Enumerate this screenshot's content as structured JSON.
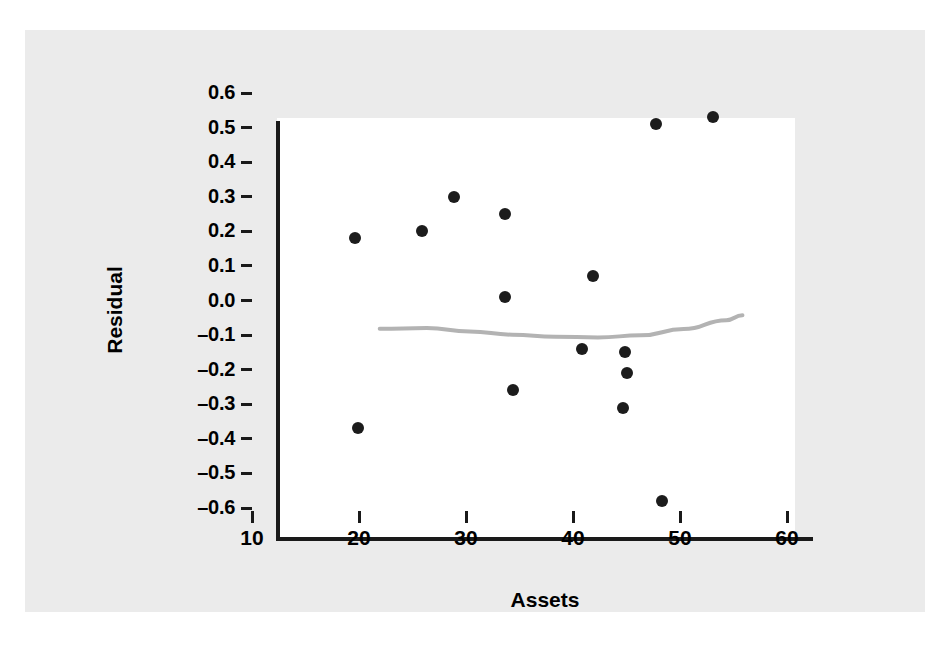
{
  "figure": {
    "background_color": "#ebebeb",
    "panel_color": "#ffffff",
    "axis_color": "#1a1a1a",
    "point_color": "#1c1c1c",
    "smoother_color": "#b3b3b3"
  },
  "chart_data": {
    "type": "scatter",
    "title": "",
    "xlabel": "Assets",
    "ylabel": "Residual",
    "xlim": [
      10,
      60
    ],
    "ylim": [
      -0.6,
      0.6
    ],
    "grid": false,
    "legend": null,
    "xticks": [
      10,
      20,
      30,
      40,
      50,
      60
    ],
    "xtick_labels": [
      "10",
      "20",
      "30",
      "40",
      "50",
      "60"
    ],
    "yticks": [
      0.6,
      0.5,
      0.4,
      0.3,
      0.2,
      0.1,
      0.0,
      -0.1,
      -0.2,
      -0.3,
      -0.4,
      -0.5,
      -0.6
    ],
    "ytick_labels": [
      "0.6",
      "0.5",
      "0.4",
      "0.3",
      "0.2",
      "0.1",
      "0.0",
      "–0.1",
      "–0.2",
      "–0.3",
      "–0.4",
      "–0.5",
      "–0.6"
    ],
    "points": [
      {
        "x": 19.6,
        "y": 0.18
      },
      {
        "x": 19.9,
        "y": -0.37
      },
      {
        "x": 25.9,
        "y": 0.2
      },
      {
        "x": 28.9,
        "y": 0.3
      },
      {
        "x": 33.6,
        "y": 0.25
      },
      {
        "x": 33.6,
        "y": 0.01
      },
      {
        "x": 34.4,
        "y": -0.26
      },
      {
        "x": 40.8,
        "y": -0.14
      },
      {
        "x": 41.9,
        "y": 0.07
      },
      {
        "x": 44.9,
        "y": -0.15
      },
      {
        "x": 45.0,
        "y": -0.21
      },
      {
        "x": 44.7,
        "y": -0.31
      },
      {
        "x": 48.3,
        "y": -0.58
      },
      {
        "x": 47.8,
        "y": 0.51
      },
      {
        "x": 53.1,
        "y": 0.53
      }
    ],
    "series": [
      {
        "name": "smoother",
        "type": "line",
        "style": "lowess",
        "points": [
          {
            "x": 19.6,
            "y": 0.005
          },
          {
            "x": 24.0,
            "y": 0.007
          },
          {
            "x": 28.0,
            "y": -0.003
          },
          {
            "x": 32.0,
            "y": -0.012
          },
          {
            "x": 36.0,
            "y": -0.018
          },
          {
            "x": 40.0,
            "y": -0.02
          },
          {
            "x": 44.0,
            "y": -0.014
          },
          {
            "x": 48.0,
            "y": 0.004
          },
          {
            "x": 52.0,
            "y": 0.03
          },
          {
            "x": 53.5,
            "y": 0.044
          }
        ]
      }
    ]
  }
}
